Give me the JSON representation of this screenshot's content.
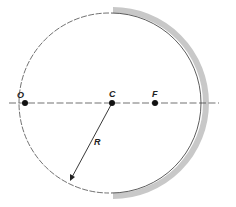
{
  "diagram": {
    "labels": {
      "object": "O",
      "center": "C",
      "focus": "F",
      "radius": "R"
    },
    "colors": {
      "mirror": "#c8c8c8",
      "line": "#222222",
      "background": "#ffffff"
    }
  }
}
